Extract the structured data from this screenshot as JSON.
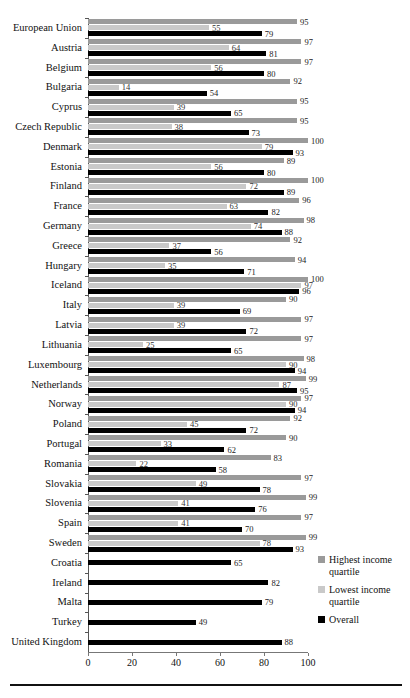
{
  "chart_data": {
    "type": "bar",
    "orientation": "horizontal",
    "title": "",
    "xlabel": "",
    "ylabel": "",
    "xlim": [
      0,
      100
    ],
    "xticks": [
      0,
      20,
      40,
      60,
      80,
      100
    ],
    "grid": false,
    "legend_position": "right-bottom",
    "categories": [
      "European Union",
      "Austria",
      "Belgium",
      "Bulgaria",
      "Cyprus",
      "Czech Republic",
      "Denmark",
      "Estonia",
      "Finland",
      "France",
      "Germany",
      "Greece",
      "Hungary",
      "Iceland",
      "Italy",
      "Latvia",
      "Lithuania",
      "Luxembourg",
      "Netherlands",
      "Norway",
      "Poland",
      "Portugal",
      "Romania",
      "Slovakia",
      "Slovenia",
      "Spain",
      "Sweden",
      "Croatia",
      "Ireland",
      "Malta",
      "Turkey",
      "United Kingdom"
    ],
    "series": [
      {
        "name": "Highest income quartile",
        "color": "#9a9a9a",
        "values": [
          95,
          97,
          97,
          92,
          95,
          95,
          100,
          89,
          100,
          96,
          98,
          92,
          94,
          100,
          90,
          97,
          97,
          98,
          99,
          97,
          92,
          90,
          83,
          97,
          99,
          97,
          99,
          null,
          null,
          null,
          null,
          null
        ]
      },
      {
        "name": "Lowest income quartile",
        "color": "#c9c9c9",
        "values": [
          55,
          64,
          56,
          14,
          39,
          38,
          79,
          56,
          72,
          63,
          74,
          37,
          35,
          97,
          39,
          39,
          25,
          90,
          87,
          90,
          45,
          33,
          22,
          49,
          41,
          41,
          78,
          null,
          null,
          null,
          null,
          null
        ]
      },
      {
        "name": "Overall",
        "color": "#000000",
        "values": [
          79,
          81,
          80,
          54,
          65,
          73,
          93,
          80,
          89,
          82,
          88,
          56,
          71,
          96,
          69,
          72,
          65,
          94,
          95,
          94,
          72,
          62,
          58,
          78,
          76,
          70,
          93,
          65,
          82,
          79,
          49,
          88
        ]
      }
    ]
  },
  "legend": {
    "items": [
      {
        "label": "Highest income quartile",
        "color": "#9a9a9a"
      },
      {
        "label": "Lowest income quartile",
        "color": "#c9c9c9"
      },
      {
        "label": "Overall",
        "color": "#000000"
      }
    ]
  }
}
